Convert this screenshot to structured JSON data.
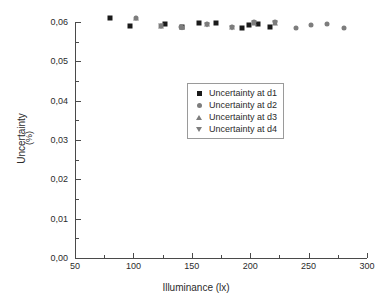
{
  "chart_data": {
    "type": "scatter",
    "title": "",
    "xlabel": "Illuminance (lx)",
    "ylabel": "Uncertainty",
    "ylabel_unit": "(%)",
    "xlim": [
      50,
      300
    ],
    "ylim": [
      0.0,
      0.065
    ],
    "grid": false,
    "legend_position": "center",
    "x_ticks": [
      "50",
      "100",
      "150",
      "200",
      "250",
      "300"
    ],
    "x_tick_values": [
      50,
      100,
      150,
      200,
      250,
      300
    ],
    "x_minor_tick_values": [
      75,
      125,
      175,
      225,
      275
    ],
    "y_ticks": [
      "0,00",
      "0,01",
      "0,02",
      "0,03",
      "0,04",
      "0,05",
      "0,06"
    ],
    "y_tick_values": [
      0.0,
      0.01,
      0.02,
      0.03,
      0.04,
      0.05,
      0.06
    ],
    "y_minor_tick_values": [
      0.005,
      0.015,
      0.025,
      0.035,
      0.045,
      0.055
    ],
    "series": [
      {
        "name": "Uncertainty at d1",
        "marker": "square",
        "color": "#1a1a1a",
        "points": [
          [
            80,
            0.0611
          ],
          [
            97,
            0.059
          ],
          [
            127,
            0.0595
          ],
          [
            142,
            0.0588
          ],
          [
            156,
            0.0597
          ],
          [
            171,
            0.0597
          ],
          [
            193,
            0.0585
          ],
          [
            199,
            0.0592
          ],
          [
            207,
            0.0594
          ],
          [
            217,
            0.0587
          ]
        ]
      },
      {
        "name": "Uncertainty at d2",
        "marker": "circle",
        "color": "#7d7d7d",
        "points": [
          [
            102,
            0.061
          ],
          [
            124,
            0.0591
          ],
          [
            141,
            0.0588
          ],
          [
            163,
            0.0594
          ],
          [
            184,
            0.0588
          ],
          [
            203,
            0.0599
          ],
          [
            221,
            0.0599
          ],
          [
            239,
            0.0585
          ],
          [
            252,
            0.0592
          ],
          [
            266,
            0.0595
          ],
          [
            280,
            0.0585
          ]
        ]
      },
      {
        "name": "Uncertainty at d3",
        "marker": "triangle-up",
        "color": "#7d7d7d",
        "points": [
          [
            102,
            0.061
          ],
          [
            124,
            0.0591
          ],
          [
            142,
            0.0587
          ],
          [
            163,
            0.0594
          ],
          [
            184,
            0.0587
          ],
          [
            203,
            0.0598
          ],
          [
            221,
            0.0598
          ]
        ]
      },
      {
        "name": "Uncertainty at d4",
        "marker": "triangle-down",
        "color": "#7d7d7d",
        "points": [
          [
            124,
            0.059
          ],
          [
            142,
            0.0586
          ],
          [
            163,
            0.0593
          ],
          [
            184,
            0.0586
          ],
          [
            203,
            0.0597
          ],
          [
            221,
            0.0597
          ]
        ]
      }
    ]
  },
  "legend": {
    "entries": [
      {
        "label": "Uncertainty at d1",
        "marker": "square"
      },
      {
        "label": "Uncertainty at d2",
        "marker": "circle"
      },
      {
        "label": "Uncertainty at d3",
        "marker": "triangle-up"
      },
      {
        "label": "Uncertainty at d4",
        "marker": "triangle-down"
      }
    ]
  }
}
